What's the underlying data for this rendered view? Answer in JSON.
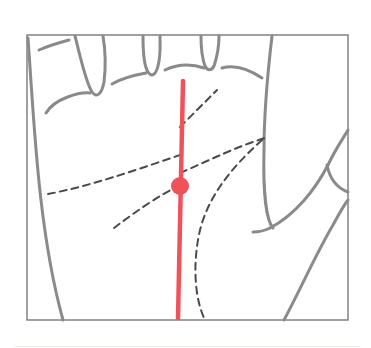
{
  "diagram": {
    "frame": {
      "x": 27,
      "y": 35,
      "width": 321,
      "height": 285,
      "stroke": "#6f6f6f"
    },
    "colors": {
      "outline": "#8a8a8a",
      "dashed_lines": "#4a4a4a",
      "highlight": "#f0525a",
      "background": "#ffffff"
    },
    "elements": [
      {
        "name": "hand-outline",
        "style": "solid gray"
      },
      {
        "name": "finger-creases",
        "style": "solid gray"
      },
      {
        "name": "thumb-outline",
        "style": "solid gray"
      },
      {
        "name": "heart-line",
        "style": "dashed"
      },
      {
        "name": "head-line",
        "style": "dashed"
      },
      {
        "name": "life-line",
        "style": "dashed"
      },
      {
        "name": "fate-line",
        "style": "solid red, highlighted"
      },
      {
        "name": "fate-line-marker",
        "style": "red dot"
      }
    ]
  }
}
